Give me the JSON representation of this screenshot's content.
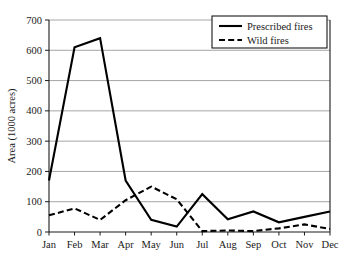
{
  "chart_data": {
    "type": "line",
    "title": "",
    "subtitle": "",
    "xlabel": "",
    "ylabel": "Area (1000 acres)",
    "categories": [
      "Jan",
      "Feb",
      "Mar",
      "Apr",
      "May",
      "Jun",
      "Jul",
      "Aug",
      "Sep",
      "Oct",
      "Nov",
      "Dec"
    ],
    "series": [
      {
        "name": "Prescribed fires",
        "style": "solid",
        "color": "#000000",
        "values": [
          170,
          610,
          640,
          170,
          40,
          18,
          125,
          42,
          68,
          32,
          50,
          68
        ]
      },
      {
        "name": "Wild fires",
        "style": "dashed",
        "color": "#000000",
        "values": [
          55,
          78,
          40,
          105,
          150,
          108,
          3,
          5,
          3,
          12,
          25,
          10
        ]
      }
    ],
    "ylim": [
      0,
      700
    ],
    "yticks": [
      0,
      100,
      200,
      300,
      400,
      500,
      600,
      700
    ],
    "ytick_labels": [
      "0",
      "100",
      "200",
      "300",
      "400",
      "500",
      "600",
      "700"
    ],
    "grid": true,
    "grid_axis": "y",
    "legend_position": "upper-right",
    "legend": [
      "Prescribed fires",
      "Wild fires"
    ]
  },
  "legend": {
    "entries": [
      {
        "label": "Prescribed fires"
      },
      {
        "label": "Wild fires"
      }
    ]
  },
  "axes": {
    "y_title": "Area (1000 acres)"
  }
}
